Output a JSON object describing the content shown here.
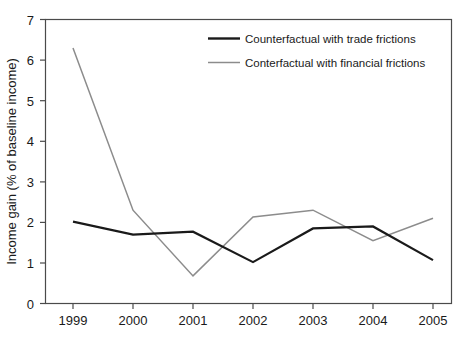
{
  "chart_data": {
    "type": "line",
    "title": "",
    "subtitle": "",
    "xlabel": "",
    "ylabel": "Income gain (% of baseline income)",
    "categories": [
      "1999",
      "2000",
      "2001",
      "2002",
      "2003",
      "2004",
      "2005"
    ],
    "x": [
      1999,
      2000,
      2001,
      2002,
      2003,
      2004,
      2005
    ],
    "series": [
      {
        "name": "Counterfactual with trade frictions",
        "color": "#1a1a1a",
        "values": [
          2.02,
          1.7,
          1.77,
          1.02,
          1.85,
          1.9,
          1.07
        ]
      },
      {
        "name": "Conterfactual with financial frictions",
        "color": "#8c8c8c",
        "values": [
          6.3,
          2.3,
          0.68,
          2.13,
          2.3,
          1.55,
          2.1
        ]
      }
    ],
    "ylim": [
      0,
      7
    ],
    "yticks": [
      "0",
      "1",
      "2",
      "3",
      "4",
      "5",
      "6",
      "7"
    ],
    "xticks": [
      "1999",
      "2000",
      "2001",
      "2002",
      "2003",
      "2004",
      "2005"
    ],
    "grid": false,
    "legend_position": "top-right"
  },
  "axes": {
    "y_tick_labels": [
      "7",
      "6",
      "5",
      "4",
      "3",
      "2",
      "1",
      "0"
    ],
    "x_tick_labels": [
      "1999",
      "2000",
      "2001",
      "2002",
      "2003",
      "2004",
      "2005"
    ],
    "y_axis_title": "Income gain (% of baseline income)"
  },
  "legend": {
    "entries": [
      {
        "label": "Counterfactual with trade frictions",
        "color": "#1a1a1a"
      },
      {
        "label": "Conterfactual with financial frictions",
        "color": "#8c8c8c"
      }
    ]
  }
}
